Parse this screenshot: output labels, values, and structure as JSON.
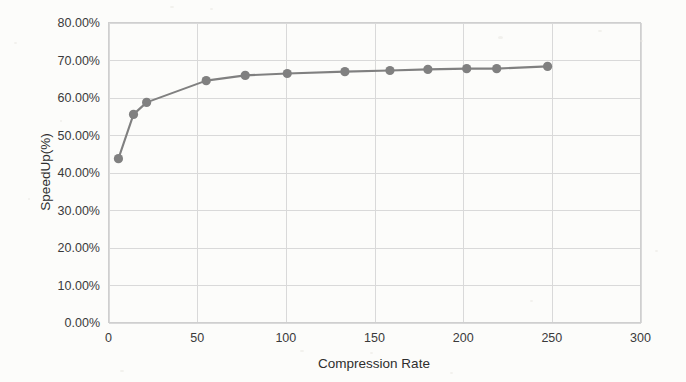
{
  "chart_data": {
    "type": "line",
    "title": "",
    "xlabel": "Compression Rate",
    "ylabel": "SpeedUp(%)",
    "xlim": [
      0,
      300
    ],
    "ylim": [
      0,
      80
    ],
    "grid": true,
    "legend": "none",
    "series_color": "#808080",
    "x_ticks": [
      "0",
      "50",
      "100",
      "150",
      "200",
      "250",
      "300"
    ],
    "x_tick_values": [
      0,
      50,
      100,
      150,
      200,
      250,
      300
    ],
    "y_ticks": [
      "0.00%",
      "10.00%",
      "20.00%",
      "30.00%",
      "40.00%",
      "50.00%",
      "60.00%",
      "70.00%",
      "80.00%"
    ],
    "y_tick_values": [
      0,
      10,
      20,
      30,
      40,
      50,
      60,
      70,
      80
    ],
    "series": [
      {
        "name": "SpeedUp",
        "x": [
          5.6,
          14.1,
          21.5,
          55.1,
          77.1,
          100.8,
          133.3,
          158.7,
          180.1,
          202.0,
          218.9,
          247.6
        ],
        "values": [
          43.7,
          55.5,
          58.7,
          64.5,
          65.9,
          66.4,
          66.9,
          67.2,
          67.5,
          67.7,
          67.7,
          68.3
        ]
      }
    ]
  },
  "axes": {
    "ylabel_text": "SpeedUp(%)",
    "xlabel_text": "Compression Rate"
  }
}
